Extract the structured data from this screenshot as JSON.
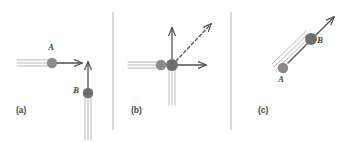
{
  "figure": {
    "width": 353,
    "height": 142,
    "background_color": "#ffffff"
  },
  "colors": {
    "particle_a_fill": "#8c8c8c",
    "particle_b_fill": "#6e6e6e",
    "arrow_stroke": "#4f4f4f",
    "trail_stroke": "#a8a8a8",
    "divider_stroke": "#b5b5b5",
    "label_fill": "#3f3f3f",
    "caption_fill": "#4a4a4a"
  },
  "dividers": [
    {
      "name": "divider-1",
      "x": 113,
      "y1": 12,
      "y2": 130
    },
    {
      "name": "divider-2",
      "x": 231,
      "y1": 12,
      "y2": 130
    }
  ],
  "panels": [
    {
      "id": "a",
      "caption": "(a)",
      "caption_x": 16,
      "caption_y": 113,
      "description": "Before collision: particle A travels to the right, particle B travels upward",
      "particles": [
        {
          "label": "A",
          "name": "particle-a",
          "cx": 52,
          "cy": 63,
          "r": 5.2,
          "fill": "#8c8c8c",
          "label_x": 51,
          "label_y": 50,
          "velocity_direction": "right",
          "velocity_angle_deg": 0
        },
        {
          "label": "B",
          "name": "particle-b",
          "cx": 88,
          "cy": 93,
          "r": 5.2,
          "fill": "#6e6e6e",
          "label_x": 76,
          "label_y": 93,
          "velocity_direction": "up",
          "velocity_angle_deg": 90
        }
      ],
      "arrows": [
        {
          "name": "velocity-arrow-a",
          "x1": 57,
          "y1": 63,
          "x2": 82,
          "y2": 63,
          "style": "solid"
        },
        {
          "name": "velocity-arrow-b",
          "x1": 88,
          "y1": 88,
          "x2": 88,
          "y2": 62,
          "style": "solid"
        }
      ],
      "trails": [
        {
          "name": "trail-a-1",
          "x1": 17,
          "y1": 60,
          "x2": 50,
          "y2": 60
        },
        {
          "name": "trail-a-2",
          "x1": 17,
          "y1": 63,
          "x2": 50,
          "y2": 63
        },
        {
          "name": "trail-a-3",
          "x1": 17,
          "y1": 66,
          "x2": 50,
          "y2": 66
        },
        {
          "name": "trail-b-1",
          "x1": 85,
          "y1": 140,
          "x2": 85,
          "y2": 96
        },
        {
          "name": "trail-b-2",
          "x1": 88,
          "y1": 140,
          "x2": 88,
          "y2": 96
        },
        {
          "name": "trail-b-3",
          "x1": 91,
          "y1": 140,
          "x2": 91,
          "y2": 96
        }
      ]
    },
    {
      "id": "b",
      "caption": "(b)",
      "caption_x": 131,
      "caption_y": 113,
      "description": "At collision: A and B meet; dashed arrow shows resultant momentum direction",
      "particles": [
        {
          "label": "A",
          "name": "particle-a",
          "cx": 161,
          "cy": 65,
          "r": 5.2,
          "fill": "#8c8c8c",
          "label_x": null,
          "label_y": null,
          "velocity_direction": "right",
          "velocity_angle_deg": 0
        },
        {
          "label": "B",
          "name": "particle-b",
          "cx": 172,
          "cy": 65,
          "r": 6.0,
          "fill": "#6e6e6e",
          "label_x": null,
          "label_y": null,
          "velocity_direction": "up",
          "velocity_angle_deg": 90
        }
      ],
      "arrows": [
        {
          "name": "velocity-arrow-a",
          "x1": 178,
          "y1": 65,
          "x2": 206,
          "y2": 65,
          "style": "solid"
        },
        {
          "name": "velocity-arrow-b",
          "x1": 172,
          "y1": 59,
          "x2": 172,
          "y2": 28,
          "style": "solid"
        },
        {
          "name": "resultant-arrow",
          "x1": 176,
          "y1": 61,
          "x2": 211,
          "y2": 24,
          "style": "dashed"
        }
      ],
      "trails": [
        {
          "name": "trail-a-1",
          "x1": 128,
          "y1": 62,
          "x2": 158,
          "y2": 62
        },
        {
          "name": "trail-a-2",
          "x1": 128,
          "y1": 65,
          "x2": 158,
          "y2": 65
        },
        {
          "name": "trail-a-3",
          "x1": 128,
          "y1": 68,
          "x2": 158,
          "y2": 68
        },
        {
          "name": "trail-b-1",
          "x1": 169,
          "y1": 105,
          "x2": 169,
          "y2": 70
        },
        {
          "name": "trail-b-2",
          "x1": 172,
          "y1": 105,
          "x2": 172,
          "y2": 70
        },
        {
          "name": "trail-b-3",
          "x1": 175,
          "y1": 105,
          "x2": 175,
          "y2": 70
        }
      ]
    },
    {
      "id": "c",
      "caption": "(c)",
      "caption_x": 258,
      "caption_y": 113,
      "description": "After collision: A and B move off together along a diagonal up-and-right path",
      "particles": [
        {
          "label": "A",
          "name": "particle-a",
          "cx": 283,
          "cy": 68,
          "r": 5.2,
          "fill": "#8c8c8c",
          "label_x": 281,
          "label_y": 82,
          "velocity_direction": "up-right",
          "velocity_angle_deg": 45
        },
        {
          "label": "B",
          "name": "particle-b",
          "cx": 311,
          "cy": 39,
          "r": 6.0,
          "fill": "#6e6e6e",
          "label_x": 320,
          "label_y": 43,
          "velocity_direction": "up-right",
          "velocity_angle_deg": 45
        }
      ],
      "arrows": [
        {
          "name": "velocity-arrow-ab",
          "x1": 288,
          "y1": 63,
          "x2": 334,
          "y2": 17,
          "style": "solid"
        }
      ],
      "trails": [
        {
          "name": "trail-1",
          "x1": 272,
          "y1": 64,
          "x2": 306,
          "y2": 31
        },
        {
          "name": "trail-2",
          "x1": 274,
          "y1": 67,
          "x2": 308,
          "y2": 34
        },
        {
          "name": "trail-3",
          "x1": 276,
          "y1": 70,
          "x2": 310,
          "y2": 37
        }
      ]
    }
  ]
}
